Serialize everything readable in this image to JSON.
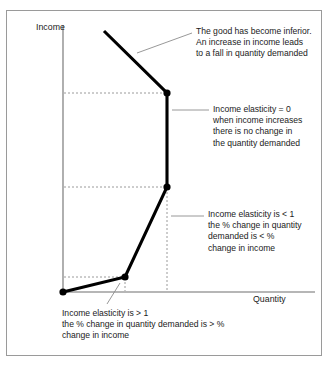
{
  "figure": {
    "axes": {
      "y_label": "Income",
      "x_label": "Quantity"
    },
    "annotations": {
      "inferior": {
        "lines": [
          "The good has become inferior.",
          "An increase in income leads",
          "to a fall in quantity demanded"
        ]
      },
      "zero_elasticity": {
        "lines": [
          "Income elasticity = 0",
          "when income increases",
          "there is no change in",
          "the quantity demanded"
        ]
      },
      "less_than_one": {
        "lines": [
          "Income elasticity is < 1",
          "the % change in quantity",
          "demanded is < %",
          "change in income"
        ]
      },
      "greater_than_one": {
        "lines": [
          "Income elasticity is > 1",
          "the % change in quantity demanded is > %",
          "change in income"
        ]
      }
    },
    "colors": {
      "curve": "#000000",
      "axis": "#6e6e6e",
      "guide": "#9a9a9a",
      "leader": "#8c8c8c",
      "border": "#9a9a9a",
      "text": "#1b1b1b"
    },
    "curve": {
      "description": "Engel curve with four segments: steep rise (elasticity > 1), shallower rise (elasticity < 1), vertical (elasticity = 0), backward-bending downward slope (inferior good)",
      "vertices": [
        {
          "name": "origin-point",
          "x": 63,
          "y": 292
        },
        {
          "name": "kink-gt1",
          "x": 125,
          "y": 277
        },
        {
          "name": "kink-lt1",
          "x": 167,
          "y": 187
        },
        {
          "name": "kink-zero",
          "x": 167,
          "y": 93
        },
        {
          "name": "curve-top-end",
          "x": 104,
          "y": 31
        }
      ]
    },
    "guides": [
      {
        "name": "guide-h-zero",
        "type": "horizontal",
        "x1": 63,
        "x2": 167,
        "y": 93
      },
      {
        "name": "guide-h-lt1",
        "type": "horizontal",
        "x1": 63,
        "x2": 167,
        "y": 187
      },
      {
        "name": "guide-h-gt1",
        "type": "horizontal",
        "x1": 63,
        "x2": 125,
        "y": 277
      },
      {
        "name": "guide-v-lt1",
        "type": "vertical",
        "x": 167,
        "y1": 187,
        "y2": 292
      },
      {
        "name": "guide-v-gt1",
        "type": "vertical",
        "x": 125,
        "y1": 277,
        "y2": 292
      }
    ]
  }
}
